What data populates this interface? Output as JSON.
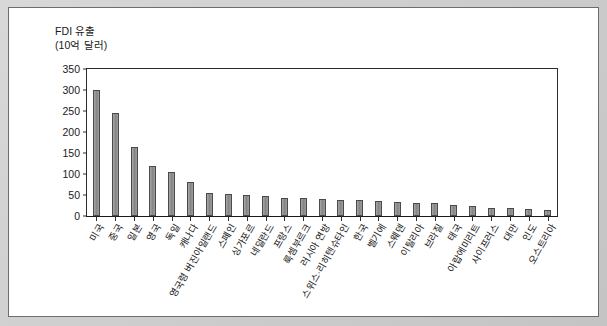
{
  "figure": {
    "axis_title_line1": "FDI 유출",
    "axis_title_line2": "(10억 달러)",
    "frame_color": "#cfcfcf",
    "panel_color": "#ffffff",
    "bar_fill_color": "#8d8d8d",
    "bar_edge_color": "#4a4a4a",
    "axis_color": "#2b2b2b"
  },
  "chart_data": {
    "type": "bar",
    "title": "FDI 유출",
    "subtitle": "(10억 달러)",
    "xlabel": "",
    "ylabel": "FDI 유출 (10억 달러)",
    "ylim": [
      0,
      350
    ],
    "yticks": [
      0,
      50,
      100,
      150,
      200,
      250,
      300,
      350
    ],
    "ytick_labels": [
      "0",
      "50",
      "100",
      "150",
      "200",
      "250",
      "300",
      "350"
    ],
    "grid": false,
    "legend": false,
    "categories": [
      "미국",
      "중국",
      "일본",
      "영국",
      "독일",
      "캐나다",
      "영국령 버진아일랜드",
      "스페인",
      "싱가포르",
      "네덜란드",
      "프랑스",
      "룩셈부르크",
      "러시아 연방",
      "스위스·리히텐슈타인",
      "한국",
      "벨기에",
      "스웨덴",
      "이탈리아",
      "브라질",
      "태국",
      "아랍에미리트",
      "사이프러스",
      "대만",
      "인도",
      "오스트리아"
    ],
    "values": [
      300,
      245,
      165,
      120,
      105,
      82,
      55,
      52,
      50,
      47,
      44,
      42,
      40,
      38,
      37,
      35,
      33,
      32,
      31,
      26,
      24,
      20,
      19,
      17,
      15
    ]
  }
}
